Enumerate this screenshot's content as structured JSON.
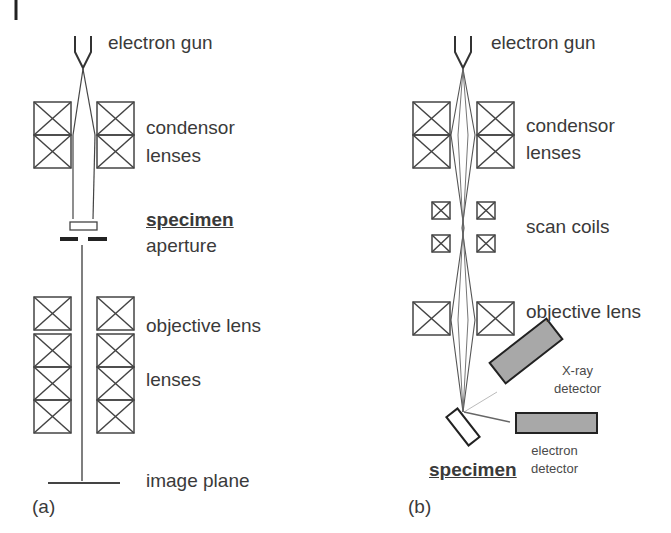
{
  "panel_a": {
    "label": "(a)",
    "electron_gun": "electron gun",
    "condensor": "condensor",
    "lenses_1": "lenses",
    "specimen": "specimen",
    "aperture": "aperture",
    "objective_lens": "objective lens",
    "lenses_2": "lenses",
    "image_plane": "image plane"
  },
  "panel_b": {
    "label": "(b)",
    "electron_gun": "electron gun",
    "condensor": "condensor",
    "lenses": "lenses",
    "scan_coils": "scan coils",
    "objective_lens": "objective lens",
    "xray_1": "X-ray",
    "xray_2": "detector",
    "electron_1": "electron",
    "electron_2": "detector",
    "specimen": "specimen"
  }
}
